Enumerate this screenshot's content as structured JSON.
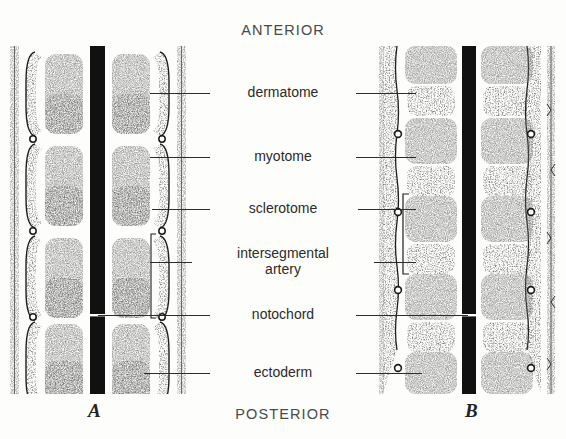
{
  "figure": {
    "orientation": {
      "anterior": "ANTERIOR",
      "posterior": "POSTERIOR"
    },
    "panels": [
      {
        "id": "a",
        "letter": "A",
        "description": "unsegmented sclerotome stage"
      },
      {
        "id": "b",
        "letter": "B",
        "description": "resegmented sclerotome stage"
      }
    ],
    "labels": [
      {
        "key": "dermatome",
        "text": "dermatome",
        "y": 93
      },
      {
        "key": "myotome",
        "text": "myotome",
        "y": 157
      },
      {
        "key": "sclerotome",
        "text": "sclerotome",
        "y": 209
      },
      {
        "key": "artery",
        "text": "intersegmental\nartery",
        "y": 262
      },
      {
        "key": "notochord",
        "text": "notochord",
        "y": 315
      },
      {
        "key": "ectoderm",
        "text": "ectoderm",
        "y": 373
      }
    ],
    "structures": {
      "notochord": "central black vertical bar",
      "sclerotome": "light stippled block",
      "myotome": "dark stippled band",
      "dermatome": "outer dark crescent",
      "intersegmental_artery": "small open circle",
      "ectoderm": "thin stippled outer strip"
    },
    "colors": {
      "background": "#fdfdfb",
      "ink": "#2d2d2d",
      "notochord": "#111111",
      "myotome_dark": "#8d8d8d",
      "sclerotome_light": "#d8d8d4",
      "label_text": "#2b2b2b",
      "orientation_text": "#4a4a4a"
    }
  }
}
